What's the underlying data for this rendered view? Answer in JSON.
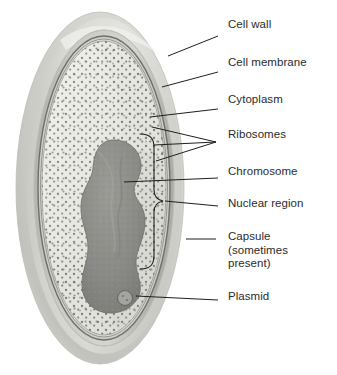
{
  "figure": {
    "view": "oblique cutaway of a rod-shaped (ovoid) bacterial cell",
    "background_color": "#ffffff",
    "text_color": "#2b2b2b",
    "leader_line_color": "#1f1f1f"
  },
  "labels": [
    {
      "id": "cell-wall",
      "text": "Cell wall",
      "x": 228,
      "y": 24,
      "leader": {
        "x1": 218,
        "y1": 36,
        "x2": 168,
        "y2": 56
      }
    },
    {
      "id": "cell-membrane",
      "text": "Cell membrane",
      "x": 228,
      "y": 62,
      "leader": {
        "x1": 218,
        "y1": 72,
        "x2": 162,
        "y2": 87
      }
    },
    {
      "id": "cytoplasm",
      "text": "Cytoplasm",
      "x": 228,
      "y": 99,
      "leader": {
        "x1": 218,
        "y1": 109,
        "x2": 150,
        "y2": 117
      }
    },
    {
      "id": "ribosomes",
      "text": "Ribosomes",
      "x": 228,
      "y": 134,
      "leader_fan_tip": {
        "x": 216,
        "y": 142
      },
      "leader_fan_targets": [
        {
          "x": 152,
          "y": 127
        },
        {
          "x": 154,
          "y": 145
        },
        {
          "x": 156,
          "y": 161
        }
      ]
    },
    {
      "id": "chromosome",
      "text": "Chromosome",
      "x": 228,
      "y": 171,
      "leader": {
        "x1": 218,
        "y1": 178,
        "x2": 124,
        "y2": 182
      }
    },
    {
      "id": "nuclear-region",
      "text": "Nuclear region",
      "x": 228,
      "y": 203,
      "leader": {
        "x1": 218,
        "y1": 206,
        "x2": 163,
        "y2": 201
      }
    },
    {
      "id": "capsule",
      "text": "Capsule\n(sometimes\npresent)",
      "x": 228,
      "y": 236,
      "leader": {
        "x1": 216,
        "y1": 239,
        "x2": 186,
        "y2": 239
      }
    },
    {
      "id": "plasmid",
      "text": "Plasmid",
      "x": 228,
      "y": 296,
      "leader": {
        "x1": 218,
        "y1": 300,
        "x2": 136,
        "y2": 296
      }
    }
  ],
  "cell_parts": [
    {
      "id": "capsule",
      "name": "Capsule",
      "color": "#cfcfcc",
      "note": "outermost translucent halo, sometimes present"
    },
    {
      "id": "cell-wall",
      "name": "Cell wall",
      "color": "#b9b9b4",
      "note": "rigid layer beneath the capsule"
    },
    {
      "id": "cell-membrane",
      "name": "Cell membrane",
      "color": "#8c8c88",
      "note": "thin dark line inside the wall"
    },
    {
      "id": "cytoplasm",
      "name": "Cytoplasm",
      "color": "#e4e4de",
      "note": "pale stippled interior"
    },
    {
      "id": "ribosomes",
      "name": "Ribosomes",
      "color": "#7c7c78",
      "note": "dense small dots filling the cytoplasm"
    },
    {
      "id": "chromosome",
      "name": "Chromosome",
      "color": "#8d8d89",
      "note": "large irregular dark mass"
    },
    {
      "id": "nuclear-region",
      "name": "Nuclear region",
      "color": "#1f1f1f",
      "note": "area marked by a curly brace around the chromosome"
    },
    {
      "id": "plasmid",
      "name": "Plasmid",
      "color": "#6f6f6b",
      "note": "small circular loop of DNA near the bottom"
    }
  ],
  "geometry": {
    "cell_center_x": 104,
    "cell_center_y": 188,
    "capsule_rx": 84,
    "capsule_ry": 176,
    "wall_rx": 70,
    "wall_ry": 158,
    "membrane_rx": 66,
    "membrane_ry": 152,
    "cytoplasm_rx": 62,
    "cytoplasm_ry": 147,
    "plasmid_cx": 125,
    "plasmid_cy": 298,
    "plasmid_r": 7
  }
}
